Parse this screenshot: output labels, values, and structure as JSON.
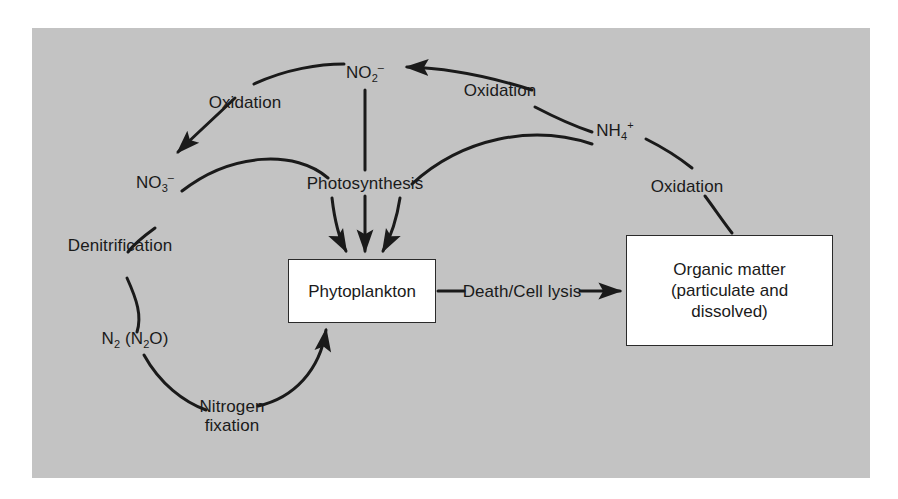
{
  "figure": {
    "panel_background_color": "#c3c3c3",
    "page_background_color": "#ffffff",
    "line_color": "#1a1a1a",
    "box_fill_color": "#ffffff"
  },
  "nodes": {
    "nitrite": {
      "formula": "NO",
      "subscript": "2",
      "superscript": "–",
      "name": "nitrite"
    },
    "nitrate": {
      "formula": "NO",
      "subscript": "3",
      "superscript": "–",
      "name": "nitrate"
    },
    "ammonium": {
      "formula": "NH",
      "subscript": "4",
      "superscript": "+",
      "name": "ammonium"
    },
    "dinitrogen": {
      "formula": "N",
      "subscript": "2",
      "paren_open": " (N",
      "paren_sub": "2",
      "paren_close": "O)",
      "name": "dinitrogen"
    },
    "phytoplankton": {
      "label": "Phytoplankton"
    },
    "organic_matter": {
      "line1": "Organic matter",
      "line2": "(particulate and",
      "line3": "dissolved)"
    }
  },
  "process_labels": {
    "oxidation_left": "Oxidation",
    "oxidation_top_right": "Oxidation",
    "oxidation_right": "Oxidation",
    "photosynthesis": "Photosynthesis",
    "denitrification": "Denitrification",
    "nitrogen_fixation_line1": "Nitrogen",
    "nitrogen_fixation_line2": "fixation",
    "death_cell_lysis": "Death/Cell lysis"
  },
  "diagram_data": {
    "type": "cycle-diagram",
    "node_list": [
      "NO2-",
      "NO3-",
      "NH4+",
      "N2 (N2O)",
      "Phytoplankton",
      "Organic matter (particulate and dissolved)"
    ],
    "edges": [
      {
        "from": "NH4+",
        "to": "NO2-",
        "label": "Oxidation",
        "arrow": true
      },
      {
        "from": "NO2-",
        "to": "NO3-",
        "label": "Oxidation",
        "arrow": true
      },
      {
        "from": "NO3-",
        "to": "Photosynthesis",
        "label": "",
        "arrow": false
      },
      {
        "from": "NO2-",
        "to": "Phytoplankton",
        "label": "Photosynthesis",
        "arrow": true
      },
      {
        "from": "NH4+",
        "to": "Photosynthesis",
        "label": "",
        "arrow": false
      },
      {
        "from": "Photosynthesis",
        "to": "Phytoplankton",
        "label": "",
        "arrow": true
      },
      {
        "from": "NO3-",
        "to": "N2 (N2O)",
        "label": "Denitrification",
        "arrow": false
      },
      {
        "from": "N2 (N2O)",
        "to": "Phytoplankton",
        "label": "Nitrogen fixation",
        "arrow": true
      },
      {
        "from": "Phytoplankton",
        "to": "Organic matter",
        "label": "Death/Cell lysis",
        "arrow": true
      },
      {
        "from": "Organic matter",
        "to": "NH4+",
        "label": "Oxidation",
        "arrow": false
      }
    ]
  }
}
